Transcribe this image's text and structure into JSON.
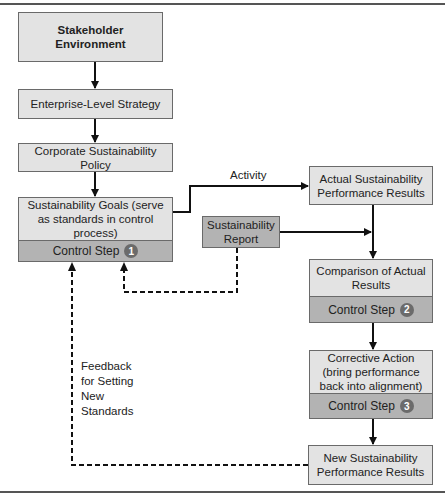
{
  "nodes": {
    "stakeholder": "Stakeholder Environment",
    "enterprise": "Enterprise-Level Strategy",
    "policy": "Corporate Sustainability Policy",
    "goals": "Sustainability Goals (serve as standards in control process)",
    "goals_step": "Control Step",
    "goals_step_num": "1",
    "actual": "Actual Sustainability Performance Results",
    "report": "Sustainability Report",
    "comparison": "Comparison of Actual Results",
    "comparison_step": "Control Step",
    "comparison_step_num": "2",
    "corrective": "Corrective Action (bring performance back into alignment)",
    "corrective_step": "Control Step",
    "corrective_step_num": "3",
    "new_results": "New Sustainability Performance Results"
  },
  "edge_labels": {
    "activity": "Activity",
    "feedback": [
      "Feedback",
      "for Setting",
      "New",
      "Standards"
    ]
  },
  "colors": {
    "box_fill": "#e3e3e3",
    "step_fill": "#b3b3b3",
    "badge": "#6b6b6b",
    "line": "#111111"
  }
}
